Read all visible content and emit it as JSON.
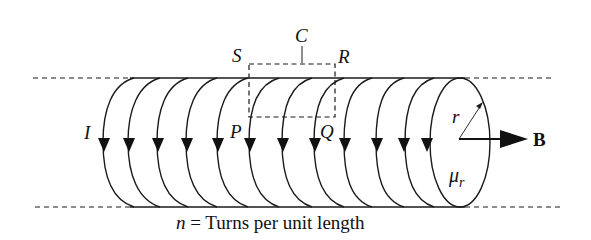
{
  "diagram": {
    "labels": {
      "current": "I",
      "loop_name": "C",
      "corner_s": "S",
      "corner_r": "R",
      "corner_p": "P",
      "corner_q": "Q",
      "radius": "r",
      "permeability_mu": "μ",
      "permeability_sub": "r",
      "field": "B",
      "caption_var": "n",
      "caption_text": " = Turns per unit length"
    },
    "colors": {
      "line": "#1a1a1a",
      "background": "#ffffff"
    },
    "coil": {
      "top_y": 78,
      "bottom_y": 207,
      "turn_count": 12,
      "arrow_direction": "down"
    }
  }
}
